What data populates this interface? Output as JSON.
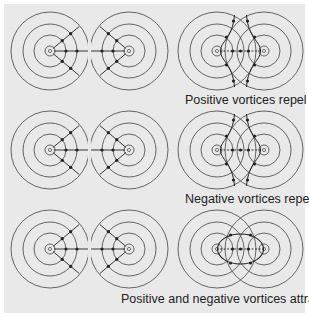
{
  "figure": {
    "background": "#e9e9e9",
    "line_color": "#555555",
    "arrow_color": "#222222",
    "rows": [
      {
        "caption": "Positive vortices repel",
        "type": "repel"
      },
      {
        "caption": "Negative vortices repel",
        "type": "repel"
      },
      {
        "caption": "Positive and negative vortices attract",
        "type": "attract"
      }
    ]
  }
}
